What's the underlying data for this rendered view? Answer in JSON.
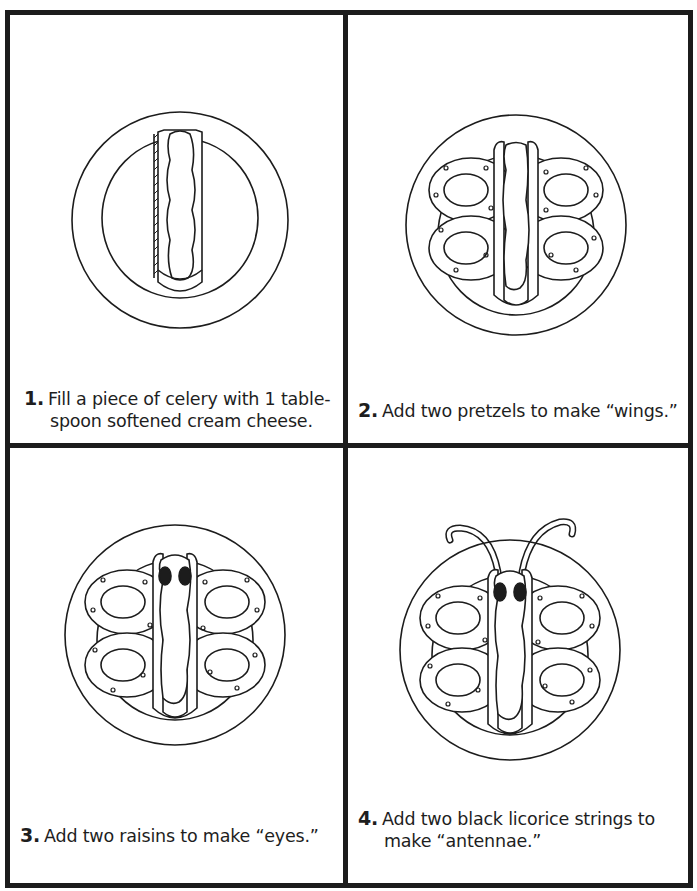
{
  "document": {
    "title": "Butterfly snack instructions",
    "colors": {
      "ink": "#1c1c1c",
      "paper": "#ffffff"
    },
    "steps": [
      {
        "number": "1.",
        "text_line1": "Fill a piece of celery with 1 table-",
        "text_line2": "spoon softened cream cheese.",
        "illustration": "celery-with-cream-cheese-on-plate"
      },
      {
        "number": "2.",
        "text_line1": "Add two pretzels to make “wings.”",
        "illustration": "celery-with-pretzel-wings-on-plate"
      },
      {
        "number": "3.",
        "text_line1": "Add two raisins to make “eyes.”",
        "illustration": "butterfly-with-raisin-eyes-on-plate"
      },
      {
        "number": "4.",
        "text_line1": "Add two black licorice strings to",
        "text_line2": "make “antennae.”",
        "illustration": "butterfly-with-licorice-antennae-on-plate"
      }
    ]
  }
}
